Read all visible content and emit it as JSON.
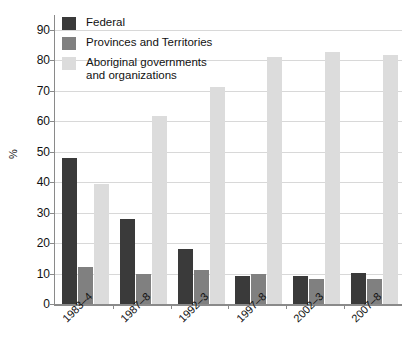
{
  "chart_data": {
    "type": "bar",
    "title": "",
    "xlabel": "",
    "ylabel": "%",
    "ylim": [
      0,
      90
    ],
    "ytick_step": 10,
    "yticks": [
      90,
      80,
      70,
      60,
      50,
      40,
      30,
      20,
      10,
      0
    ],
    "grid": true,
    "legend_position": "top-left",
    "categories": [
      "1983–4",
      "1987–8",
      "1992–3",
      "1997–8",
      "2002–3",
      "2007–8"
    ],
    "series": [
      {
        "name": "Federal",
        "color": "#3a3a3a",
        "values": [
          48,
          28,
          18,
          9.3,
          9.3,
          10.3
        ]
      },
      {
        "name": "Provinces and Territories",
        "color": "#808080",
        "values": [
          12,
          10,
          11.3,
          10,
          8.3,
          8.3
        ]
      },
      {
        "name": "Aboriginal governments\nand organizations",
        "color": "#dcdcdc",
        "values": [
          39.5,
          61.7,
          71.3,
          81.3,
          82.7,
          81.7
        ]
      }
    ]
  },
  "axis": {
    "y_title": "%",
    "y_tick_labels": [
      "90",
      "80",
      "70",
      "60",
      "50",
      "40",
      "30",
      "20",
      "10",
      "0"
    ],
    "x_tick_labels": [
      "1983–4",
      "1987–8",
      "1992–3",
      "1997–8",
      "2002–3",
      "2007–8"
    ]
  },
  "legend": {
    "items": [
      {
        "label": "Federal",
        "color": "#3a3a3a"
      },
      {
        "label": "Provinces and Territories",
        "color": "#808080"
      },
      {
        "label": "Aboriginal governments\nand organizations",
        "color": "#dcdcdc"
      }
    ]
  },
  "colors": {
    "federal": "#3a3a3a",
    "provinces": "#808080",
    "aboriginal": "#dcdcdc",
    "gridline": "#d8d8d8",
    "axis": "#8a8a8a",
    "text": "#111111",
    "background": "#ffffff"
  }
}
